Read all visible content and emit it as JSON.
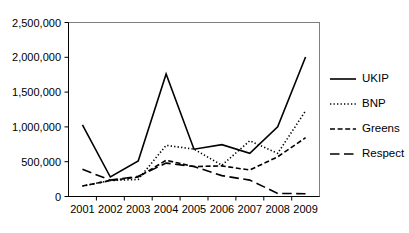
{
  "chart_data": {
    "type": "line",
    "title": "",
    "subtitle": "",
    "xlabel": "",
    "ylabel": "",
    "x": [
      2001,
      2002,
      2003,
      2004,
      2005,
      2006,
      2007,
      2008,
      2009
    ],
    "categories": [
      "2001",
      "2002",
      "2003",
      "2004",
      "2005",
      "2006",
      "2007",
      "2008",
      "2009"
    ],
    "xtick_labels": [
      "2001",
      "2002",
      "2003",
      "2004",
      "2005",
      "2006",
      "2007",
      "2008",
      "2009"
    ],
    "ytick_labels": [
      "0",
      "500,000",
      "1,000,000",
      "1,500,000",
      "2,000,000",
      "2,500,000"
    ],
    "ytick_values": [
      0,
      500000,
      1000000,
      1500000,
      2000000,
      2500000
    ],
    "ylim": [
      0,
      2500000
    ],
    "xlim": [
      2001,
      2009
    ],
    "grid": false,
    "legend_position": "right",
    "series": [
      {
        "name": "UKIP",
        "style": "solid",
        "color": "#000000",
        "values": [
          1030000,
          280000,
          510000,
          1760000,
          680000,
          745000,
          620000,
          1000000,
          2005000
        ]
      },
      {
        "name": "BNP",
        "style": "dotted",
        "color": "#000000",
        "values": [
          150000,
          230000,
          245000,
          735000,
          680000,
          450000,
          800000,
          620000,
          1230000
        ]
      },
      {
        "name": "Greens",
        "style": "dashed",
        "color": "#000000",
        "values": [
          150000,
          230000,
          280000,
          520000,
          430000,
          440000,
          380000,
          570000,
          845000
        ]
      },
      {
        "name": "Respect",
        "style": "longdash",
        "color": "#000000",
        "values": [
          390000,
          235000,
          290000,
          480000,
          430000,
          300000,
          235000,
          45000,
          40000
        ]
      }
    ]
  },
  "legend": {
    "items": [
      {
        "label": "UKIP"
      },
      {
        "label": "BNP"
      },
      {
        "label": "Greens"
      },
      {
        "label": "Respect"
      }
    ]
  },
  "axes": {
    "y": {
      "labels": [
        "2,500,000",
        "2,000,000",
        "1,500,000",
        "1,000,000",
        "500,000",
        "0"
      ]
    },
    "x": {
      "labels": [
        "2001",
        "2002",
        "2003",
        "2004",
        "2005",
        "2006",
        "2007",
        "2008",
        "2009"
      ]
    }
  }
}
